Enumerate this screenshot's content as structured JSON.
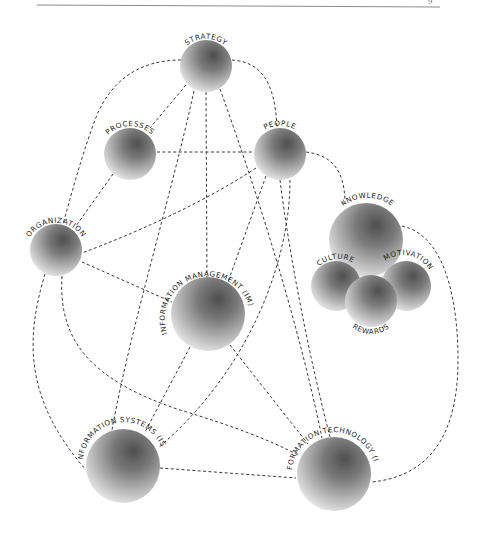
{
  "page": {
    "page_number_fragment": "9"
  },
  "diagram": {
    "type": "network",
    "style": {
      "node_fill": "radial gray gradient",
      "edge_style": "dashed",
      "edge_color": "#3c3c3c",
      "sphere_dark": "#5a5a5a",
      "sphere_light": "#f2f2f2"
    },
    "nodes": [
      {
        "id": "strategy",
        "label": "STRATEGY",
        "cx": 206,
        "cy": 66,
        "r": 26
      },
      {
        "id": "processes",
        "label": "PROCESSES",
        "cx": 130,
        "cy": 154,
        "r": 26
      },
      {
        "id": "people",
        "label": "PEOPLE",
        "cx": 280,
        "cy": 154,
        "r": 26
      },
      {
        "id": "organization",
        "label": "ORGANIZATION",
        "cx": 56,
        "cy": 250,
        "r": 26
      },
      {
        "id": "knowledge",
        "label": "KNOWLEDGE",
        "cx": 366,
        "cy": 240,
        "r": 37
      },
      {
        "id": "culture",
        "label": "CULTURE",
        "cx": 336,
        "cy": 286,
        "r": 25
      },
      {
        "id": "motivation",
        "label": "MOTIVATION",
        "cx": 406,
        "cy": 286,
        "r": 25
      },
      {
        "id": "rewards",
        "label": "REWARDS",
        "cx": 371,
        "cy": 301,
        "r": 26
      },
      {
        "id": "im",
        "label": "INFORMATION MANAGEMENT (IM)",
        "cx": 208,
        "cy": 314,
        "r": 37
      },
      {
        "id": "is",
        "label": "INFORMATION SYSTEMS (IS)",
        "cx": 123,
        "cy": 466,
        "r": 37
      },
      {
        "id": "it",
        "label": "INFORMATION TECHNOLOGY (IT)",
        "cx": 334,
        "cy": 474,
        "r": 37
      }
    ],
    "edges": [
      {
        "from": "strategy",
        "to": "organization"
      },
      {
        "from": "strategy",
        "to": "processes"
      },
      {
        "from": "strategy",
        "to": "people"
      },
      {
        "from": "strategy",
        "to": "im"
      },
      {
        "from": "strategy",
        "to": "is"
      },
      {
        "from": "strategy",
        "to": "it"
      },
      {
        "from": "processes",
        "to": "people"
      },
      {
        "from": "processes",
        "to": "organization"
      },
      {
        "from": "people",
        "to": "organization"
      },
      {
        "from": "people",
        "to": "knowledge"
      },
      {
        "from": "people",
        "to": "im"
      },
      {
        "from": "people",
        "to": "is"
      },
      {
        "from": "people",
        "to": "it"
      },
      {
        "from": "organization",
        "to": "im"
      },
      {
        "from": "organization",
        "to": "is"
      },
      {
        "from": "organization",
        "to": "it"
      },
      {
        "from": "im",
        "to": "is"
      },
      {
        "from": "im",
        "to": "it"
      },
      {
        "from": "is",
        "to": "it"
      },
      {
        "from": "knowledge",
        "to": "it"
      }
    ]
  }
}
